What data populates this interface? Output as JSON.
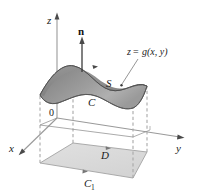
{
  "figure": {
    "background_color": "#ffffff",
    "axes": {
      "z_label": "z",
      "y_label": "y",
      "x_label": "x",
      "origin_label": "0",
      "axis_color": "#9a9a9a"
    },
    "labels": {
      "normal_vector": "n",
      "surface": "S",
      "surface_equation_z": "z",
      "surface_equation_eq": "=",
      "surface_equation_fn": "g(x, y)",
      "surface_equation_full": "z = g(x, y)",
      "boundary_curve_upper": "C",
      "region": "D",
      "boundary_curve_lower": "C",
      "boundary_curve_lower_subscript": "1",
      "boundary_curve_lower_full": "C1"
    },
    "colors": {
      "surface_fill_dark": "#8f8f8f",
      "surface_fill_light": "#b4b4b4",
      "surface_edge": "#5a5a5a",
      "region_fill": "#dcdcdc",
      "region_edge": "#9d9d9d",
      "dashed_stroke": "#a8a8a8",
      "text": "#1a1a1a",
      "arrow": "#4a4a4a"
    }
  }
}
